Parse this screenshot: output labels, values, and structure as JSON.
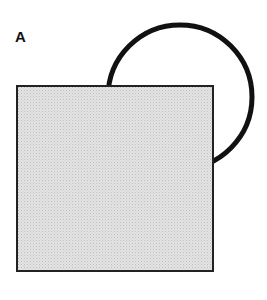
{
  "figure": {
    "panel_label": "A",
    "shapes": {
      "circle": {
        "cx": 180,
        "cy": 97,
        "r": 72,
        "stroke": "#111111",
        "stroke_width": 5,
        "fill": "none"
      },
      "square": {
        "x": 17,
        "y": 86,
        "width": 196,
        "height": 185,
        "fill": "#dcdcdc",
        "stroke": "#222222",
        "stroke_width": 2
      }
    }
  }
}
